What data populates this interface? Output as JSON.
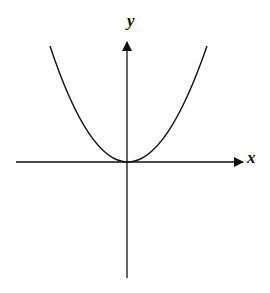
{
  "diagram": {
    "type": "function-graph",
    "function": "y = x^2",
    "x_axis_label": "x",
    "y_axis_label": "y",
    "curve": "parabola opening upward with vertex at origin",
    "colors": {
      "background": "#ffffff",
      "stroke": "#111111"
    }
  }
}
